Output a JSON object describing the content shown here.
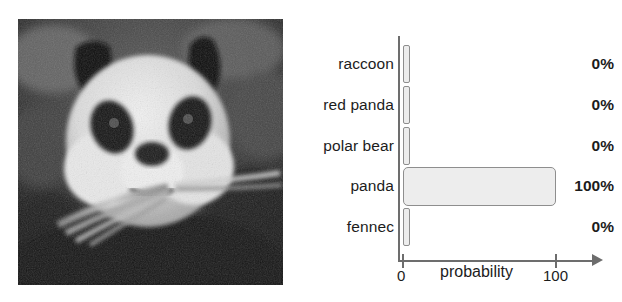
{
  "figure": {
    "photo": {
      "subject_label": "panda-photograph",
      "alt": "grayscale noisy photograph of a giant panda eating bamboo"
    }
  },
  "chart_data": {
    "type": "bar",
    "orientation": "horizontal",
    "title": "",
    "xlabel": "probability",
    "ylabel": "",
    "xlim": [
      0,
      100
    ],
    "xticks": [
      0,
      100
    ],
    "xtick_labels": [
      "0",
      "100"
    ],
    "grid": false,
    "legend": false,
    "categories": [
      "raccoon",
      "red panda",
      "polar bear",
      "panda",
      "fennec"
    ],
    "values": [
      0,
      0,
      0,
      100,
      0
    ],
    "value_labels": [
      "0%",
      "0%",
      "0%",
      "100%",
      "0%"
    ],
    "colors": {
      "bar_fill": "#ededed",
      "bar_border": "#8e8e8e",
      "axis": "#6d6d6d",
      "text": "#1c1c1c",
      "background": "#ffffff"
    }
  }
}
